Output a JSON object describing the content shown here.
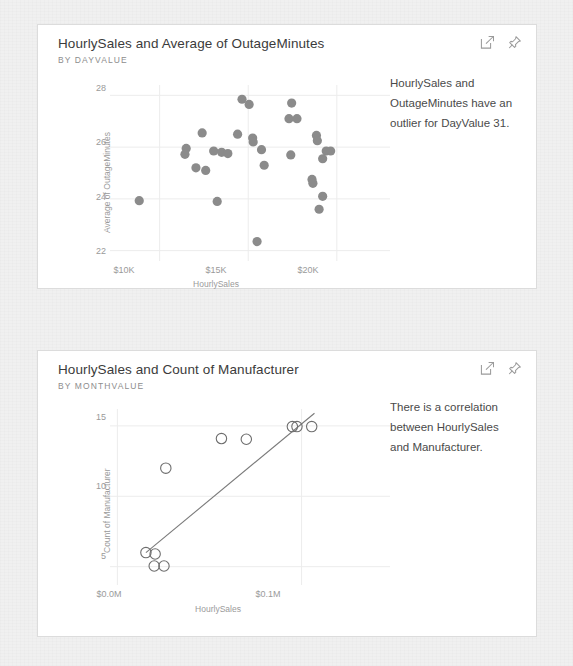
{
  "cards": [
    {
      "title": "HourlySales and Average of OutageMinutes",
      "subtitle": "BY DAYVALUE",
      "insight": "HourlySales and OutageMinutes have an outlier for DayValue 31.",
      "actions": {
        "focus_label": "focus-mode",
        "pin_label": "pin-visual"
      },
      "chart_data": {
        "type": "scatter",
        "title": "HourlySales and Average of OutageMinutes",
        "subtitle": "BY DAYVALUE",
        "xlabel": "HourlySales",
        "ylabel": "Average of OutageMinutes",
        "xticks": [
          "$10K",
          "$15K",
          "$20K"
        ],
        "xtick_values": [
          10000,
          15000,
          20000
        ],
        "yticks": [
          "22",
          "24",
          "26",
          "28"
        ],
        "ytick_values": [
          22,
          24,
          26,
          28
        ],
        "xlim": [
          7200,
          23000
        ],
        "ylim": [
          21.6,
          28.4
        ],
        "grid": true,
        "legend": "none",
        "marker": "filled-circle",
        "marker_color": "#8b8b8b",
        "points": [
          {
            "x": 8850,
            "y": 23.93
          },
          {
            "x": 12400,
            "y": 26.55
          },
          {
            "x": 11500,
            "y": 25.95
          },
          {
            "x": 11430,
            "y": 25.72
          },
          {
            "x": 12050,
            "y": 25.2
          },
          {
            "x": 12600,
            "y": 25.1
          },
          {
            "x": 13050,
            "y": 25.85
          },
          {
            "x": 13500,
            "y": 25.8
          },
          {
            "x": 13850,
            "y": 25.75
          },
          {
            "x": 13250,
            "y": 23.9
          },
          {
            "x": 14650,
            "y": 27.85
          },
          {
            "x": 15050,
            "y": 27.65
          },
          {
            "x": 14400,
            "y": 26.5
          },
          {
            "x": 15250,
            "y": 26.35
          },
          {
            "x": 15280,
            "y": 26.2
          },
          {
            "x": 15750,
            "y": 25.9
          },
          {
            "x": 15900,
            "y": 25.3
          },
          {
            "x": 15500,
            "y": 22.35
          },
          {
            "x": 17450,
            "y": 27.7
          },
          {
            "x": 17300,
            "y": 27.1
          },
          {
            "x": 17750,
            "y": 27.1
          },
          {
            "x": 17400,
            "y": 25.7
          },
          {
            "x": 18850,
            "y": 26.45
          },
          {
            "x": 18900,
            "y": 26.25
          },
          {
            "x": 19400,
            "y": 25.85
          },
          {
            "x": 19650,
            "y": 25.85
          },
          {
            "x": 19200,
            "y": 25.55
          },
          {
            "x": 18600,
            "y": 24.75
          },
          {
            "x": 18650,
            "y": 24.6
          },
          {
            "x": 19200,
            "y": 24.1
          },
          {
            "x": 19000,
            "y": 23.6
          }
        ]
      }
    },
    {
      "title": "HourlySales and Count of Manufacturer",
      "subtitle": "BY MONTHVALUE",
      "insight": "There is a correlation between HourlySales and Manufacturer.",
      "actions": {
        "focus_label": "focus-mode",
        "pin_label": "pin-visual"
      },
      "chart_data": {
        "type": "scatter",
        "title": "HourlySales and Count of Manufacturer",
        "subtitle": "BY MONTHVALUE",
        "xlabel": "HourlySales",
        "ylabel": "Count of Manufacturer",
        "xticks": [
          "$0.0M",
          "$0.1M"
        ],
        "xtick_values": [
          0.0,
          0.1
        ],
        "yticks": [
          "5",
          "10",
          "15"
        ],
        "ytick_values": [
          5,
          10,
          15
        ],
        "xlim": [
          -0.004,
          0.148
        ],
        "ylim": [
          3.7,
          16.2
        ],
        "grid": true,
        "legend": "none",
        "marker": "open-circle",
        "marker_color": "#6e6e6e",
        "trendline": {
          "x0": 0.0155,
          "y0": 6.0,
          "x1": 0.107,
          "y1": 15.9,
          "color": "#7a7a7a"
        },
        "points": [
          {
            "x": 0.0155,
            "y": 6.0
          },
          {
            "x": 0.0205,
            "y": 5.9
          },
          {
            "x": 0.02,
            "y": 5.05
          },
          {
            "x": 0.0253,
            "y": 5.05
          },
          {
            "x": 0.0263,
            "y": 12.0
          },
          {
            "x": 0.0565,
            "y": 14.1
          },
          {
            "x": 0.07,
            "y": 14.05
          },
          {
            "x": 0.095,
            "y": 14.95
          },
          {
            "x": 0.0975,
            "y": 14.95
          },
          {
            "x": 0.1055,
            "y": 14.95
          }
        ]
      }
    }
  ]
}
